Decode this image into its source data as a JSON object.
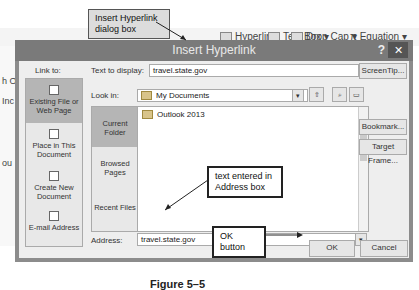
{
  "ribbon": {
    "hyperlink": "Hyperlink",
    "text_box": "Text Box",
    "drop_cap": "Drop Cap",
    "equation": "Equation",
    "bg_text": [
      "h Os",
      "Inc",
      "ou"
    ]
  },
  "dialog": {
    "title": "Insert Hyperlink",
    "help": "?",
    "close": "✕",
    "link_to_label": "Link to:",
    "link_to_items": [
      {
        "label": "Existing File or Web Page",
        "icon": "web-page-icon",
        "selected": true
      },
      {
        "label": "Place in This Document",
        "icon": "document-place-icon",
        "selected": false
      },
      {
        "label": "Create New Document",
        "icon": "new-document-icon",
        "selected": false
      },
      {
        "label": "E-mail Address",
        "icon": "email-icon",
        "selected": false
      }
    ],
    "text_to_display_label": "Text to display:",
    "text_to_display_value": "travel.state.gov",
    "screentip_button": "ScreenTip...",
    "look_in_label": "Look in:",
    "look_in_value": "My Documents",
    "nav_items": [
      {
        "label": "Current Folder",
        "selected": true
      },
      {
        "label": "Browsed Pages",
        "selected": false
      },
      {
        "label": "Recent Files",
        "selected": false
      }
    ],
    "files": [
      "Outlook 2013"
    ],
    "bookmark_button": "Bookmark...",
    "target_frame_button": "Target Frame...",
    "address_label": "Address:",
    "address_value": "travel.state.gov",
    "ok_button": "OK",
    "cancel_button": "Cancel"
  },
  "callouts": {
    "dialog_box": "Insert Hyperlink dialog box",
    "address": "text entered in Address box",
    "ok": "OK button"
  },
  "figure_caption": "Figure 5–5"
}
